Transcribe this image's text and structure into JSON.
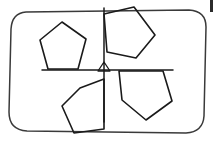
{
  "figure": {
    "background_color": "#ffffff",
    "ink_color": "#1a1a1a",
    "frame_color": "#3a3a3a",
    "width": 218,
    "height": 141,
    "frame": {
      "label": "hand-drawn rounded rectangle border",
      "path": "M 26 12 Q 12 13 11 29 L 9 112 Q 9 130 27 131 L 186 133 Q 203 132 204 116 L 206 27 Q 206 11 189 10 Z"
    },
    "center_point": {
      "label": "center of rotation",
      "x": 104,
      "y": 70,
      "marker": "small-triangle"
    },
    "axes": [
      {
        "name": "horizontal-axis",
        "x1": 42,
        "y1": 70,
        "x2": 173,
        "y2": 70
      },
      {
        "name": "vertical-axis",
        "x1": 104,
        "y1": 8,
        "x2": 104,
        "y2": 122
      }
    ],
    "pentagons": [
      {
        "name": "pentagon-top-left",
        "position": "upper-left quadrant, flat base resting on horizontal axis",
        "points": "40 40, 62 22, 86 39, 78 69, 48 69"
      },
      {
        "name": "pentagon-top-right",
        "position": "upper-right quadrant, rotated clockwise",
        "points": "104 14, 134 7, 155 35, 136 58, 107 52"
      },
      {
        "name": "pentagon-bottom-left",
        "position": "lower-left quadrant, rotated",
        "points": "80 88, 104 79, 104 129, 74 133, 62 106"
      },
      {
        "name": "pentagon-bottom-right",
        "position": "lower-right quadrant, flat top along horizontal axis",
        "points": "119 71, 163 71, 172 101, 146 120, 122 100"
      }
    ],
    "corner_mark": {
      "name": "edge-scan-artifact",
      "x": 210,
      "y": 0,
      "width": 3,
      "height": 12
    }
  }
}
